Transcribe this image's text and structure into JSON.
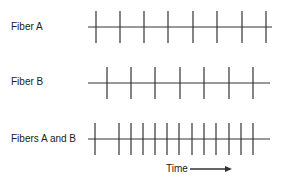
{
  "rows": [
    {
      "label": "Fiber A",
      "label_x": 11,
      "label_y": 21,
      "y": 27,
      "x1": 88,
      "x2": 272,
      "ticks": [
        96,
        120,
        144,
        168,
        193,
        217,
        242,
        266
      ]
    },
    {
      "label": "Fiber B",
      "label_x": 11,
      "label_y": 76,
      "y": 83,
      "x1": 88,
      "x2": 270,
      "ticks": [
        107,
        131,
        155,
        180,
        204,
        229,
        253
      ]
    },
    {
      "label": "Fibers A and B",
      "label_x": 11,
      "label_y": 133,
      "y": 139,
      "x1": 88,
      "x2": 270,
      "ticks": [
        95,
        119,
        131,
        143,
        155,
        167,
        179,
        192,
        204,
        216,
        229,
        241,
        253
      ]
    }
  ],
  "tick_half_height": 16,
  "time_axis": {
    "label": "Time",
    "label_x": 166,
    "label_y": 163,
    "arrow_x1": 190,
    "arrow_x2": 232,
    "arrow_y": 169
  },
  "colors": {
    "stroke": "#333333"
  }
}
